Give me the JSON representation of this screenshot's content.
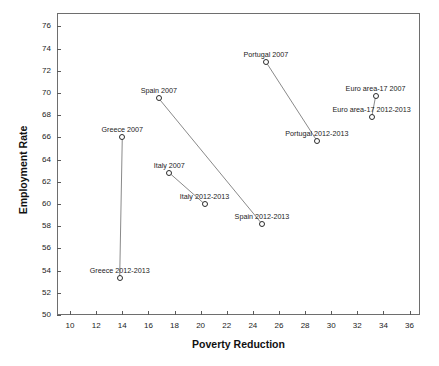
{
  "chart_data": {
    "type": "scatter",
    "title": "",
    "xlabel": "Poverty Reduction",
    "ylabel": "Employment Rate",
    "xlim": [
      9,
      36.8
    ],
    "ylim": [
      50,
      77.2
    ],
    "xticks": [
      10,
      12,
      14,
      16,
      18,
      20,
      22,
      24,
      26,
      28,
      30,
      32,
      34,
      36
    ],
    "yticks": [
      50,
      52,
      54,
      56,
      58,
      60,
      62,
      64,
      66,
      68,
      70,
      72,
      74,
      76
    ],
    "grid": false,
    "legend": "none",
    "marker_style": "open-circle",
    "points": [
      {
        "label": "Greece 2007",
        "x": 14.0,
        "y": 66.0,
        "label_dx": 0,
        "label_dy": -11
      },
      {
        "label": "Greece 2012-2013",
        "x": 13.8,
        "y": 53.3,
        "label_dx": 0,
        "label_dy": -11
      },
      {
        "label": "Spain 2007",
        "x": 16.8,
        "y": 69.5,
        "label_dx": 0,
        "label_dy": -11
      },
      {
        "label": "Spain 2012-2013",
        "x": 24.7,
        "y": 58.2,
        "label_dx": 0,
        "label_dy": -11
      },
      {
        "label": "Italy 2007",
        "x": 17.6,
        "y": 62.8,
        "label_dx": 0,
        "label_dy": -11
      },
      {
        "label": "Italy 2012-2013",
        "x": 20.3,
        "y": 60.0,
        "label_dx": 0,
        "label_dy": -11
      },
      {
        "label": "Portugal 2007",
        "x": 25.0,
        "y": 72.8,
        "label_dx": 0,
        "label_dy": -11
      },
      {
        "label": "Portugal 2012-2013",
        "x": 28.9,
        "y": 65.7,
        "label_dx": 0,
        "label_dy": -11
      },
      {
        "label": "Euro area-17 2007",
        "x": 33.4,
        "y": 69.7,
        "label_dx": 0,
        "label_dy": -11
      },
      {
        "label": "Euro area-17 2012-2013",
        "x": 33.1,
        "y": 67.8,
        "label_dx": 0,
        "label_dy": -11
      }
    ],
    "connectors": [
      {
        "name": "greece-connector",
        "from": "Greece 2007",
        "to": "Greece 2012-2013"
      },
      {
        "name": "spain-connector",
        "from": "Spain 2007",
        "to": "Spain 2012-2013"
      },
      {
        "name": "italy-connector",
        "from": "Italy 2007",
        "to": "Italy 2012-2013"
      },
      {
        "name": "portugal-connector",
        "from": "Portugal 2007",
        "to": "Portugal 2012-2013"
      },
      {
        "name": "euro-area-connector",
        "from": "Euro area-17 2007",
        "to": "Euro area-17 2012-2013"
      }
    ],
    "colors": {
      "marker_stroke": "#2b2b2b",
      "connector": "#8a8a8a",
      "axis": "#6e6e6e",
      "text": "#1c1c1c"
    }
  }
}
